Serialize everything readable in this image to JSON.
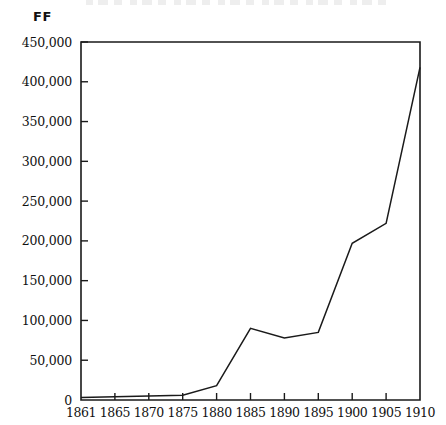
{
  "chart_data": {
    "type": "line",
    "title": "",
    "xlabel": "",
    "ylabel": "FF",
    "y_unit_label": "FF",
    "categories": [
      "1861",
      "1865",
      "1870",
      "1875",
      "1880",
      "1885",
      "1890",
      "1895",
      "1900",
      "1905",
      "1910"
    ],
    "x": [
      1861,
      1865,
      1870,
      1875,
      1880,
      1885,
      1890,
      1895,
      1900,
      1905,
      1910
    ],
    "values": [
      3000,
      4000,
      5000,
      6000,
      18000,
      90000,
      78000,
      85000,
      197000,
      222000,
      418000
    ],
    "series": [
      {
        "name": "",
        "values": [
          3000,
          4000,
          5000,
          6000,
          18000,
          90000,
          78000,
          85000,
          197000,
          222000,
          418000
        ]
      }
    ],
    "ylim": [
      0,
      450000
    ],
    "ytick_values": [
      0,
      50000,
      100000,
      150000,
      200000,
      250000,
      300000,
      350000,
      400000,
      450000
    ],
    "ytick_labels": [
      "0",
      "50,000",
      "100,000",
      "150,000",
      "200,000",
      "250,000",
      "300,000",
      "350,000",
      "400,000",
      "450,000"
    ],
    "xtick_labels": [
      "1861",
      "1865",
      "1870",
      "1875",
      "1880",
      "1885",
      "1890",
      "1895",
      "1900",
      "1905",
      "1910"
    ],
    "grid": false,
    "legend": false,
    "legend_position": "none",
    "line_color": "#1a1a1a",
    "frame_color": "#1a1a1a",
    "background_color": "#ffffff",
    "annotations": []
  },
  "layout": {
    "plot_left": 81,
    "plot_right": 420,
    "plot_top": 42,
    "plot_bottom": 400
  }
}
